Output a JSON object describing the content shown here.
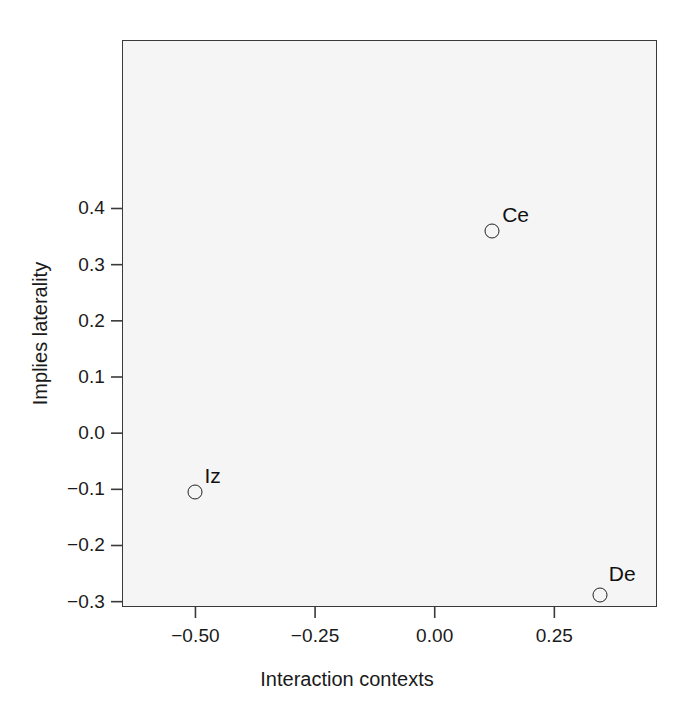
{
  "chart_data": {
    "type": "scatter",
    "title": "",
    "xlabel": "Interaction contexts",
    "ylabel": "Implies laterality",
    "xlim": [
      -0.6535,
      0.4645
    ],
    "ylim": [
      -0.3095,
      0.7
    ],
    "xticks": [
      -0.5,
      -0.25,
      0.0,
      0.25
    ],
    "xtick_labels": [
      "−0.50",
      "−0.25",
      "0.00",
      "0.25"
    ],
    "yticks": [
      -0.3,
      -0.2,
      -0.1,
      0.0,
      0.1,
      0.2,
      0.3,
      0.4
    ],
    "ytick_labels": [
      "−0.3",
      "−0.2",
      "−0.1",
      "0.0",
      "0.1",
      "0.2",
      "0.3",
      "0.4"
    ],
    "grid": false,
    "legend": null,
    "points": [
      {
        "label": "Ce",
        "x": 0.12,
        "y": 0.36,
        "label_dx": 10,
        "label_dy": -16
      },
      {
        "label": "Iz",
        "x": -0.5,
        "y": -0.105,
        "label_dx": 9,
        "label_dy": -16
      },
      {
        "label": "De",
        "x": 0.345,
        "y": -0.289,
        "label_dx": 9,
        "label_dy": -21
      }
    ]
  },
  "style": {
    "panel_background": "#f5f5f5",
    "page_background": "#ffffff",
    "axis_color": "#3a3a3a",
    "marker_color": "#222222",
    "text_color": "#1a1a1a"
  }
}
